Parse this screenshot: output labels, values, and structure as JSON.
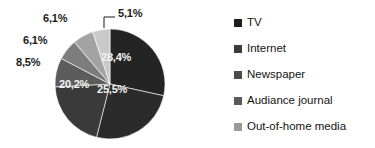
{
  "chart_data": {
    "type": "pie",
    "title": "",
    "subtitle": "",
    "xlabel": "",
    "ylabel": "",
    "grid": false,
    "legend_position": "right",
    "value_suffix": "%",
    "decimal_separator": ",",
    "start_angle_deg": 0,
    "direction": "clockwise",
    "categories": [
      "TV",
      "Internet",
      "Newspaper",
      "Audiance journal",
      "Out-of-home media"
    ],
    "slices": [
      {
        "label": "28,4%",
        "value": 28.4,
        "color": "#242424",
        "label_position": "inside",
        "label_x": 101,
        "label_y": 52,
        "leader": false
      },
      {
        "label": "25,5%",
        "value": 25.5,
        "color": "#2b2b2b",
        "label_position": "inside",
        "label_x": 97,
        "label_y": 84,
        "leader": false
      },
      {
        "label": "20,2%",
        "value": 20.2,
        "color": "#3a3a3a",
        "label_position": "inside",
        "label_x": 59,
        "label_y": 79,
        "leader": false
      },
      {
        "label": "8,5%",
        "value": 8.5,
        "color": "#5c5c5c",
        "label_position": "outside",
        "label_x": 16,
        "label_y": 57,
        "leader": false
      },
      {
        "label": "6,1%",
        "value": 6.1,
        "color": "#7d7d7d",
        "label_position": "outside",
        "label_x": 23,
        "label_y": 35,
        "leader": false
      },
      {
        "label": "6,1%",
        "value": 6.1,
        "color": "#a3a3a3",
        "label_position": "outside",
        "label_x": 43,
        "label_y": 13,
        "leader": false
      },
      {
        "label": "5,1%",
        "value": 5.1,
        "color": "#c9c9c9",
        "label_position": "outside",
        "label_x": 118,
        "label_y": 8,
        "leader": true
      }
    ],
    "legend": [
      {
        "label": "TV",
        "color": "#1f1f1f"
      },
      {
        "label": "Internet",
        "color": "#3b3b3b"
      },
      {
        "label": "Newspaper",
        "color": "#4d4d4d"
      },
      {
        "label": "Audiance journal",
        "color": "#5a5a5a"
      },
      {
        "label": "Out-of-home media",
        "color": "#9a9a9a"
      }
    ]
  },
  "geometry": {
    "cx": 110,
    "cy": 84,
    "r": 55
  }
}
